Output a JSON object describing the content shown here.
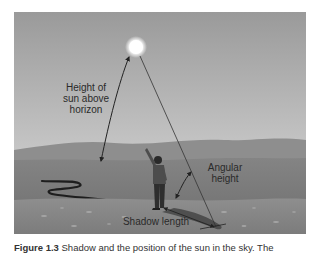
{
  "figure": {
    "labels": {
      "sun_height": [
        "Height of",
        "sun above",
        "horizon"
      ],
      "angular_height": [
        "Angular",
        "height"
      ],
      "shadow_length": "Shadow length"
    },
    "colors": {
      "sky_top": "#9a9a9a",
      "sky_bottom": "#dedede",
      "far_hills": "#8c8c8c",
      "mid_ground": "#7d7d7d",
      "near_ground": "#8a8a8a",
      "sun": "#ffffff",
      "lines": "#333333"
    }
  },
  "caption": {
    "number": "Figure 1.3",
    "text": "Shadow and the position of the sun in the sky. The"
  }
}
